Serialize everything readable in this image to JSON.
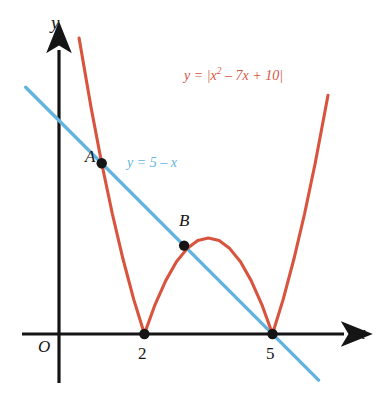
{
  "figure": {
    "background_color": "#ffffff",
    "axis_color": "#151515",
    "curve_color": "#d9543f",
    "line_color": "#62b4df",
    "point_color": "#151515"
  },
  "axes": {
    "x_axis_label": "x",
    "y_axis_label": "y",
    "origin_label": "O",
    "x_ticks": [
      {
        "label": "2",
        "value": 2
      },
      {
        "label": "5",
        "value": 5
      }
    ]
  },
  "labels": {
    "curve_equation_prefix": "y = |x",
    "curve_equation_exponent": "2",
    "curve_equation_suffix": " – 7x + 10|",
    "curve_equation_full": "y = |x² – 7x + 10|",
    "line_equation": "y = 5 – x",
    "point_a_label": "A",
    "point_b_label": "B"
  },
  "chart_data": {
    "type": "line",
    "title": "",
    "xlabel": "x",
    "ylabel": "y",
    "xlim": [
      -0.9,
      7.6
    ],
    "ylim": [
      -1.15,
      6.9
    ],
    "grid": false,
    "legend": "none",
    "series": [
      {
        "name": "y = |x² – 7x + 10|",
        "color": "#d9543f",
        "expression": "abs(x^2 - 7x + 10)",
        "x_domain": [
          0.47,
          6.3
        ],
        "roots": [
          2,
          5
        ],
        "local_max": {
          "x": 3.5,
          "y": 2.25
        },
        "points": [
          {
            "x": 0.47,
            "y": 6.93
          },
          {
            "x": 0.75,
            "y": 5.31
          },
          {
            "x": 1.0,
            "y": 4.0
          },
          {
            "x": 1.25,
            "y": 2.81
          },
          {
            "x": 1.5,
            "y": 1.75
          },
          {
            "x": 1.75,
            "y": 0.81
          },
          {
            "x": 2.0,
            "y": 0.0
          },
          {
            "x": 2.25,
            "y": 0.69
          },
          {
            "x": 2.5,
            "y": 1.25
          },
          {
            "x": 2.75,
            "y": 1.69
          },
          {
            "x": 3.0,
            "y": 2.0
          },
          {
            "x": 3.25,
            "y": 2.19
          },
          {
            "x": 3.5,
            "y": 2.25
          },
          {
            "x": 3.75,
            "y": 2.19
          },
          {
            "x": 4.0,
            "y": 2.0
          },
          {
            "x": 4.25,
            "y": 1.69
          },
          {
            "x": 4.5,
            "y": 1.25
          },
          {
            "x": 4.75,
            "y": 0.69
          },
          {
            "x": 5.0,
            "y": 0.0
          },
          {
            "x": 5.25,
            "y": 0.81
          },
          {
            "x": 5.5,
            "y": 1.75
          },
          {
            "x": 5.75,
            "y": 2.81
          },
          {
            "x": 6.0,
            "y": 4.0
          },
          {
            "x": 6.3,
            "y": 5.59
          }
        ]
      },
      {
        "name": "y = 5 – x",
        "color": "#62b4df",
        "expression": "5 - x",
        "x_domain": [
          -0.78,
          6.08
        ],
        "points": [
          {
            "x": -0.78,
            "y": 5.78
          },
          {
            "x": 6.08,
            "y": -1.08
          }
        ]
      }
    ],
    "annotated_points": [
      {
        "label": "A",
        "x": 1.0,
        "y": 4.0
      },
      {
        "label": "B",
        "x": 2.93,
        "y": 2.07
      },
      {
        "label": "",
        "x": 2.0,
        "y": 0.0
      },
      {
        "label": "",
        "x": 5.0,
        "y": 0.0
      }
    ]
  }
}
